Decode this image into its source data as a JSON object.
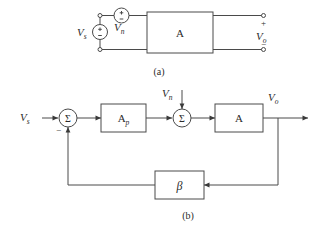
{
  "figure": {
    "background_color": "#ffffff",
    "line_color": "#4a4a4a",
    "text_color": "#2b2b2b",
    "width": 318,
    "height": 233
  },
  "panel_a": {
    "caption": "(a)",
    "source_label": "V",
    "source_sub": "s",
    "noise_label": "V",
    "noise_sub": "n",
    "amplifier_label": "A",
    "output_label": "V",
    "output_sub": "o",
    "source_plus": "+",
    "source_minus": "−",
    "noise_plus": "+",
    "noise_minus": "−",
    "output_plus": "+",
    "output_minus": "−"
  },
  "panel_b": {
    "caption": "(b)",
    "input_label": "V",
    "input_sub": "s",
    "noise_label": "V",
    "noise_sub": "n",
    "output_label": "V",
    "output_sub": "o",
    "summer1_symbol": "Σ",
    "summer2_symbol": "Σ",
    "summer1_minus": "−",
    "preamp_label": "A",
    "preamp_sub": "p",
    "amplifier_label": "A",
    "feedback_label": "β"
  }
}
